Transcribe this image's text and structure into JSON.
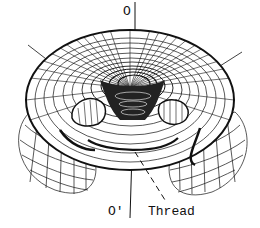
{
  "diagram": {
    "type": "wireframe-torus-surface",
    "labels": {
      "top_axis": "O",
      "bottom_axis": "O'",
      "thread": "Thread"
    },
    "colors": {
      "line": "#111111",
      "background": "#ffffff"
    }
  }
}
